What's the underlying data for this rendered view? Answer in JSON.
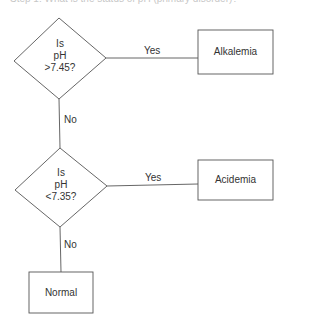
{
  "header": {
    "cutoff_text": "Step 1: What is the status of pH (primary disorder)?"
  },
  "diagram": {
    "decisions": [
      {
        "id": "ph-high",
        "lines": [
          "Is",
          "pH",
          ">7.45?"
        ]
      },
      {
        "id": "ph-low",
        "lines": [
          "Is",
          "pH",
          "<7.35?"
        ]
      }
    ],
    "outcomes": [
      {
        "id": "alkalemia",
        "label": "Alkalemia"
      },
      {
        "id": "acidemia",
        "label": "Acidemia"
      },
      {
        "id": "normal",
        "label": "Normal"
      }
    ],
    "edges": [
      {
        "from": "ph-high",
        "to": "alkalemia",
        "label": "Yes"
      },
      {
        "from": "ph-high",
        "to": "ph-low",
        "label": "No"
      },
      {
        "from": "ph-low",
        "to": "acidemia",
        "label": "Yes"
      },
      {
        "from": "ph-low",
        "to": "normal",
        "label": "No"
      }
    ],
    "stroke_color": "#555555"
  }
}
